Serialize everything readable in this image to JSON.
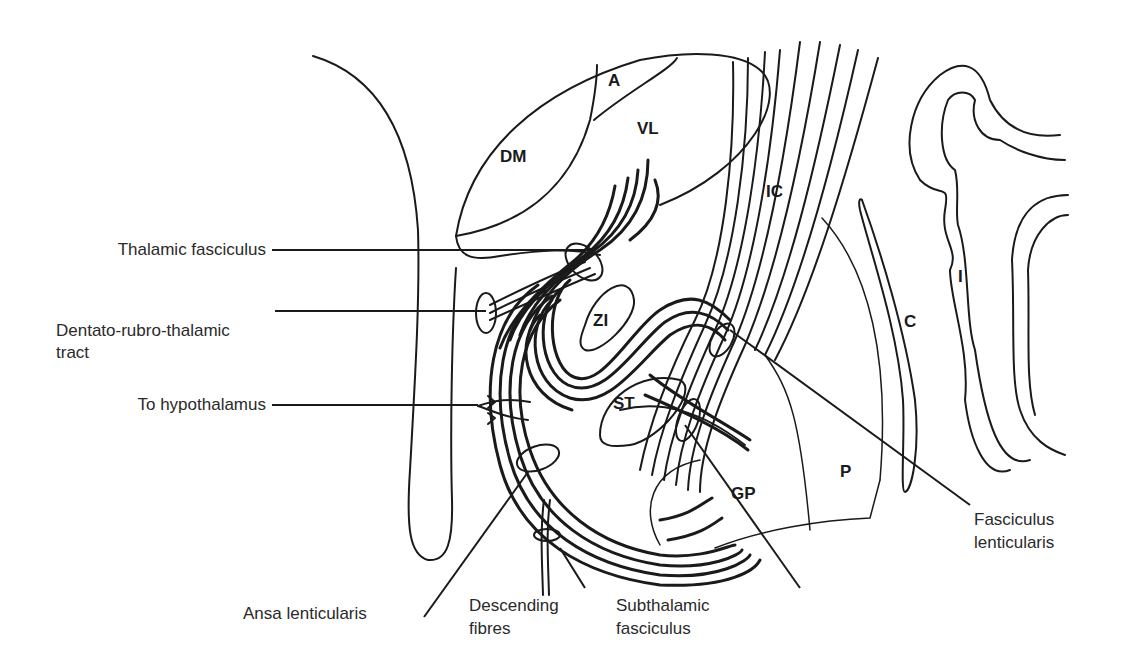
{
  "diagram": {
    "type": "anatomical-line-drawing",
    "colors": {
      "line": "#1a1a1a",
      "text": "#2a2a2a",
      "background": "#ffffff"
    },
    "structures": {
      "A": "A",
      "DM": "DM",
      "VL": "VL",
      "IC": "IC",
      "ZI": "ZI",
      "ST": "ST",
      "GP": "GP",
      "P": "P",
      "C": "C",
      "I": "I"
    },
    "labels": {
      "thalamic_fasciculus": "Thalamic fasciculus",
      "dentato_line1": "Dentato-rubro-thalamic",
      "dentato_line2": "tract",
      "to_hypothalamus": "To hypothalamus",
      "ansa_lenticularis": "Ansa lenticularis",
      "descending_line1": "Descending",
      "descending_line2": "fibres",
      "subthalamic_line1": "Subthalamic",
      "subthalamic_line2": "fasciculus",
      "fasciculus_line1": "Fasciculus",
      "fasciculus_line2": "lenticularis"
    }
  }
}
